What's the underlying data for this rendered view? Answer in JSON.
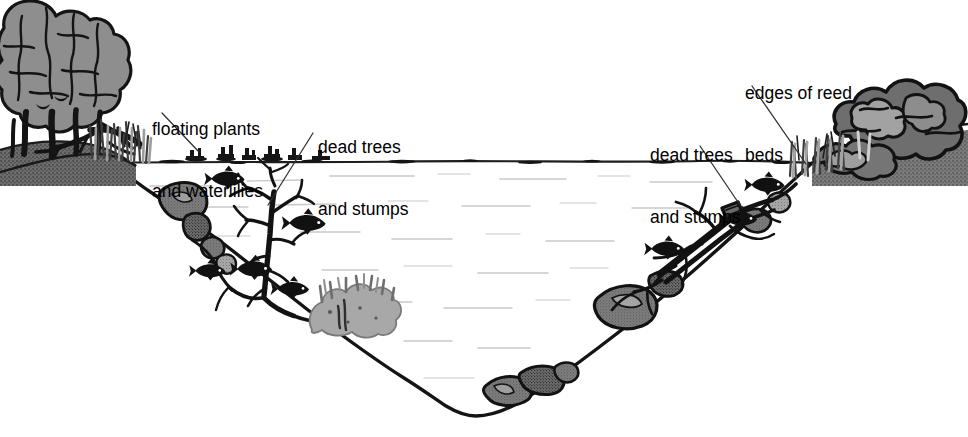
{
  "diagram": {
    "background_color": "#ffffff",
    "ink_color": "#000000",
    "palette": {
      "ink": "#1a1a1a",
      "water_ripple": "#b9b9b9",
      "rock_gray": "#7d7d7d",
      "rock_gray_light": "#9a9a9a",
      "bank_dark": "#6e6e6e",
      "foliage_gray": "#8e8e8e",
      "foliage_dark": "#5f5f5f",
      "weed_gray": "#a8a8a8",
      "reed_gray": "#8a8a8a",
      "fish_black": "#111111",
      "leader_line": "#3a3a3a"
    }
  },
  "labels": [
    {
      "id": "floating-plants",
      "text_line1": "floating plants",
      "text_line2": "and waterlilies",
      "x": 152,
      "y": 78,
      "leader": {
        "x1": 162,
        "y1": 113,
        "x2": 199,
        "y2": 152
      }
    },
    {
      "id": "dead-trees-left",
      "text_line1": "dead trees",
      "text_line2": "and stumps",
      "x": 318,
      "y": 96,
      "leader": {
        "x1": 313,
        "y1": 133,
        "x2": 268,
        "y2": 205
      }
    },
    {
      "id": "dead-trees-right",
      "text_line1": "dead trees",
      "text_line2": "and stumps",
      "x": 650,
      "y": 104,
      "leader": {
        "x1": 700,
        "y1": 146,
        "x2": 742,
        "y2": 208
      }
    },
    {
      "id": "edges-of-reed-beds",
      "text_line1": "edges of reed",
      "text_line2": "beds",
      "x": 745,
      "y": 42,
      "leader": {
        "x1": 752,
        "y1": 86,
        "x2": 806,
        "y2": 164
      }
    }
  ],
  "scene_elements": {
    "water_surface_y": 162,
    "water_ripples_count": 26,
    "fish_count": 8,
    "rock_count": 12,
    "left_bank": "trees with fallen log and reed bed",
    "right_bank": "dense bushes with reed bed",
    "submerged_features": [
      "dead tree with bare branches (left slope)",
      "gray weed bed (left slope)",
      "fallen log with branches (right slope)",
      "rocks along both slopes and lake floor"
    ]
  }
}
